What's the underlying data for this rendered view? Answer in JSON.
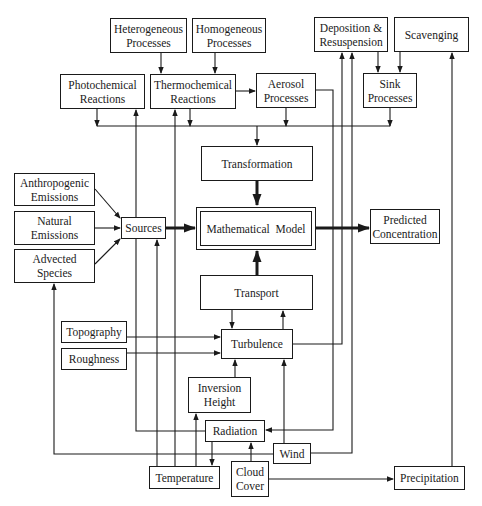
{
  "diagram": {
    "nodes": {
      "heterogeneous_processes": {
        "line1": "Heterogeneous",
        "line2": "Processes"
      },
      "homogeneous_processes": {
        "line1": "Homogeneous",
        "line2": "Processes"
      },
      "deposition_resuspension": {
        "line1": "Deposition &",
        "line2": "Resuspension"
      },
      "scavenging": {
        "line1": "Scavenging"
      },
      "photochemical_reactions": {
        "line1": "Photochemical",
        "line2": "Reactions"
      },
      "thermochemical_reactions": {
        "line1": "Thermochemical",
        "line2": "Reactions"
      },
      "aerosol_processes": {
        "line1": "Aerosol",
        "line2": "Processes"
      },
      "sink_processes": {
        "line1": "Sink",
        "line2": "Processes"
      },
      "transformation": {
        "line1": "Transformation"
      },
      "anthropogenic_emissions": {
        "line1": "Anthropogenic",
        "line2": "Emissions"
      },
      "natural_emissions": {
        "line1": "Natural",
        "line2": "Emissions"
      },
      "advected_species": {
        "line1": "Advected",
        "line2": "Species"
      },
      "sources": {
        "line1": "Sources"
      },
      "mathematical_model": {
        "line1": "Mathematical  Model"
      },
      "predicted_concentration": {
        "line1": "Predicted",
        "line2": "Concentration"
      },
      "transport": {
        "line1": "Transport"
      },
      "topography": {
        "line1": "Topography"
      },
      "roughness": {
        "line1": "Roughness"
      },
      "turbulence": {
        "line1": "Turbulence"
      },
      "inversion_height": {
        "line1": "Inversion",
        "line2": "Height"
      },
      "radiation": {
        "line1": "Radiation"
      },
      "wind": {
        "line1": "Wind"
      },
      "temperature": {
        "line1": "Temperature"
      },
      "cloud_cover": {
        "line1": "Cloud",
        "line2": "Cover"
      },
      "precipitation": {
        "line1": "Precipitation"
      }
    },
    "edges": [
      {
        "from": "Heterogeneous Processes",
        "to": "Thermochemical Reactions"
      },
      {
        "from": "Homogeneous Processes",
        "to": "Thermochemical Reactions"
      },
      {
        "from": "Thermochemical Reactions",
        "to": "Aerosol Processes"
      },
      {
        "from": "Deposition & Resuspension",
        "to": "Sink Processes"
      },
      {
        "from": "Scavenging",
        "to": "Sink Processes"
      },
      {
        "from": "Photochemical Reactions",
        "to": "Transformation"
      },
      {
        "from": "Thermochemical Reactions",
        "to": "Transformation"
      },
      {
        "from": "Aerosol Processes",
        "to": "Transformation"
      },
      {
        "from": "Sink Processes",
        "to": "Transformation"
      },
      {
        "from": "Transformation",
        "to": "Mathematical Model",
        "style": "thick"
      },
      {
        "from": "Anthropogenic Emissions",
        "to": "Sources"
      },
      {
        "from": "Natural Emissions",
        "to": "Sources"
      },
      {
        "from": "Advected Species",
        "to": "Sources"
      },
      {
        "from": "Sources",
        "to": "Mathematical Model",
        "style": "thick"
      },
      {
        "from": "Mathematical Model",
        "to": "Predicted Concentration",
        "style": "thick"
      },
      {
        "from": "Transport",
        "to": "Mathematical Model",
        "style": "thick"
      },
      {
        "from": "Transport",
        "to": "Turbulence"
      },
      {
        "from": "Turbulence",
        "to": "Transport"
      },
      {
        "from": "Topography",
        "to": "Turbulence"
      },
      {
        "from": "Roughness",
        "to": "Turbulence"
      },
      {
        "from": "Inversion Height",
        "to": "Turbulence"
      },
      {
        "from": "Wind",
        "to": "Turbulence"
      },
      {
        "from": "Turbulence",
        "to": "Deposition & Resuspension"
      },
      {
        "from": "Aerosol Processes",
        "to": "Radiation"
      },
      {
        "from": "Radiation",
        "to": "Photochemical Reactions"
      },
      {
        "from": "Radiation",
        "to": "Temperature"
      },
      {
        "from": "Temperature",
        "to": "Inversion Height"
      },
      {
        "from": "Temperature",
        "to": "Thermochemical Reactions"
      },
      {
        "from": "Temperature",
        "to": "Sources"
      },
      {
        "from": "Cloud Cover",
        "to": "Radiation"
      },
      {
        "from": "Cloud Cover",
        "to": "Precipitation"
      },
      {
        "from": "Wind",
        "to": "Advected Species"
      },
      {
        "from": "Wind",
        "to": "Deposition & Resuspension"
      },
      {
        "from": "Precipitation",
        "to": "Scavenging"
      }
    ]
  }
}
